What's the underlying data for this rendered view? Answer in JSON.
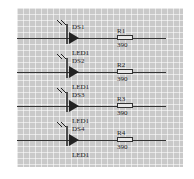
{
  "schematic": {
    "rows": [
      {
        "led_ref": "DS1",
        "led_value": "LED1",
        "res_ref": "R1",
        "res_value": "390"
      },
      {
        "led_ref": "DS2",
        "led_value": "LED1",
        "res_ref": "R2",
        "res_value": "390"
      },
      {
        "led_ref": "DS3",
        "led_value": "LED1",
        "res_ref": "R3",
        "res_value": "390"
      },
      {
        "led_ref": "DS4",
        "led_value": "LED1",
        "res_ref": "R4",
        "res_value": "390"
      }
    ],
    "colors": {
      "grid_bg": "#c9c9c9",
      "wire": "#333333"
    }
  }
}
